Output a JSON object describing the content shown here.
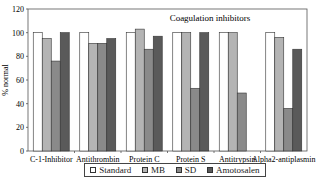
{
  "chart_data": {
    "type": "bar",
    "title": "Coagulation inhibitors",
    "xlabel": "",
    "ylabel": "% normal",
    "ylim": [
      0,
      120
    ],
    "yticks": [
      0,
      20,
      40,
      60,
      80,
      100,
      120
    ],
    "grid": false,
    "legend_position": "bottom",
    "categories": [
      "C-1-Inhibitor",
      "Antithrombin",
      "Protein C",
      "Protein S",
      "Antitrypsin",
      "Alpha2-antiplasmin"
    ],
    "series": [
      {
        "name": "Standard",
        "color": "#ffffff",
        "values": [
          100,
          100,
          100,
          100,
          100,
          100
        ]
      },
      {
        "name": "MB",
        "color": "#b4b4b4",
        "values": [
          95,
          91,
          103,
          100,
          100,
          96
        ]
      },
      {
        "name": "SD",
        "color": "#8a8a8a",
        "values": [
          76,
          91,
          86,
          53,
          49,
          36
        ]
      },
      {
        "name": "Amotosalen",
        "color": "#5a5a5a",
        "values": [
          100,
          95,
          97,
          100,
          null,
          86
        ]
      }
    ]
  },
  "legend": {
    "items": [
      {
        "label": "Standard",
        "color": "#ffffff"
      },
      {
        "label": "MB",
        "color": "#b4b4b4"
      },
      {
        "label": "SD",
        "color": "#8a8a8a"
      },
      {
        "label": "Amotosalen",
        "color": "#5a5a5a"
      }
    ]
  }
}
